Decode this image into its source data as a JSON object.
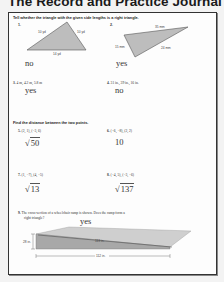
{
  "header": {
    "title": "The Record and Practice Journal"
  },
  "section1": {
    "instruction": "Tell whether the triangle with the given side lengths is a right triangle.",
    "problems": [
      {
        "number": "1.",
        "type": "triangle",
        "sides": [
          "10 yd",
          "10 yd",
          "14 yd"
        ],
        "answer": "no"
      },
      {
        "number": "2.",
        "type": "triangle",
        "sides": [
          "35 mm",
          "15 mm",
          "24 mm"
        ],
        "answer": "yes"
      },
      {
        "number": "3.",
        "text": "4 m, 4.2 m, 5.8 m",
        "answer": "yes"
      },
      {
        "number": "4.",
        "text": "31 in., 39 in., 16 in.",
        "answer": "no"
      }
    ]
  },
  "section2": {
    "instruction": "Find the distance between the two points.",
    "problems": [
      {
        "number": "5.",
        "text": "(2, 1), (−3, 6)",
        "answer_radical": "50",
        "answer_prefix": "√"
      },
      {
        "number": "6.",
        "text": "(−6, −8), (2, 2)",
        "answer": "10"
      },
      {
        "number": "7.",
        "text": "(1, −7), (4, −5)",
        "answer_radical": "13",
        "answer_prefix": "√"
      },
      {
        "number": "8.",
        "text": "(−4, 5), (−3, −6)",
        "answer_radical": "137",
        "answer_prefix": "√"
      }
    ]
  },
  "section3": {
    "number": "9.",
    "text_line1": "The cross-section of a wheelchair ramp is shown. Does the ramp form a",
    "text_line2": "right triangle?",
    "answer": "yes",
    "labels": {
      "hypotenuse": "113 in.",
      "height": "28 in.",
      "base": "112 in."
    }
  },
  "colors": {
    "page_bg": "#fdfdfd",
    "border": "#333333",
    "triangle_fill": "#bdbdbd",
    "ramp_top": "#cfcfcf",
    "ramp_side": "#9e9e9e"
  }
}
